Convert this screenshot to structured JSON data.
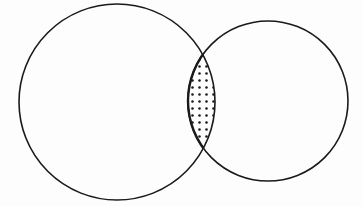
{
  "diagram": {
    "type": "venn",
    "title": "",
    "circles": [
      {
        "id": "A",
        "label": "",
        "cx": 117,
        "cy": 102,
        "r": 98
      },
      {
        "id": "B",
        "label": "",
        "cx": 268,
        "cy": 101,
        "r": 80
      }
    ],
    "intersection": {
      "label": "",
      "fill_pattern": "dots",
      "shaded": true
    },
    "colors": {
      "stroke": "#1a1a1a",
      "background": "#fdfdfd",
      "dot": "#1a1a1a"
    }
  }
}
